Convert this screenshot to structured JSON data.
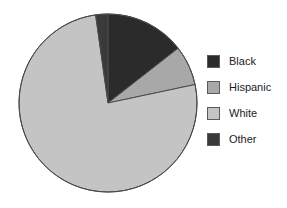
{
  "chart_data": {
    "type": "pie",
    "title": "",
    "categories": [
      "Black",
      "Hispanic",
      "White",
      "Other"
    ],
    "values": [
      14.4,
      7.2,
      76.1,
      2.3
    ],
    "value_unit": "percent",
    "slice_angles_deg": [
      52,
      26,
      274,
      8
    ],
    "start_angle_deg": 0,
    "direction": "clockwise",
    "colors": [
      "#2b2b2b",
      "#a8a8a8",
      "#c4c4c4",
      "#3a3a3a"
    ],
    "outline_color": "#4a4a4a",
    "legend": {
      "position": "right",
      "entries": [
        {
          "label": "Black",
          "color": "#2b2b2b"
        },
        {
          "label": "Hispanic",
          "color": "#a8a8a8"
        },
        {
          "label": "White",
          "color": "#c4c4c4"
        },
        {
          "label": "Other",
          "color": "#3a3a3a"
        }
      ]
    },
    "xlabel": "",
    "ylabel": "",
    "grid": false
  },
  "figure": {
    "background": "#ffffff"
  }
}
